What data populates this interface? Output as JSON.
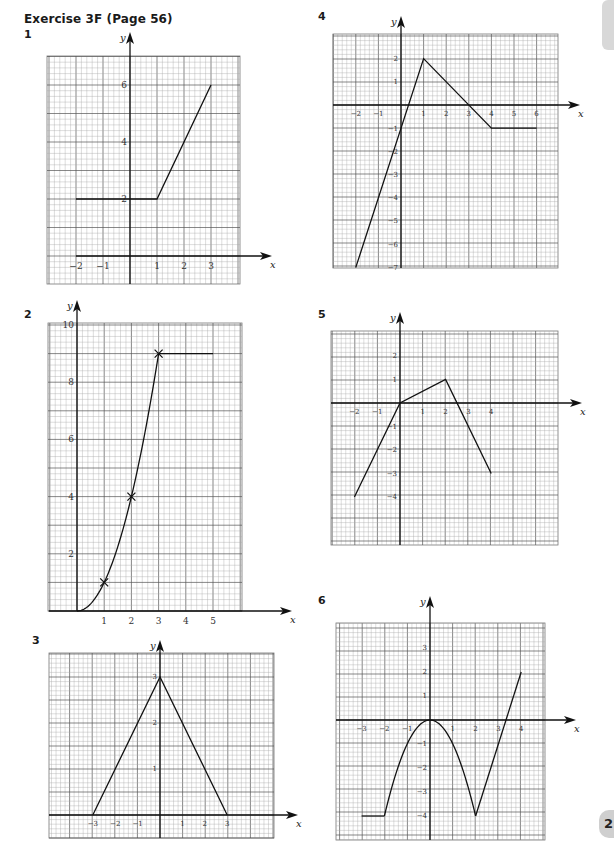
{
  "page": {
    "title": "Exercise 3F (Page 56)",
    "page_number_partial": "2"
  },
  "chart_data": [
    {
      "id": "1",
      "type": "line",
      "title": "1",
      "xlabel": "x",
      "ylabel": "y",
      "grid": true,
      "box": {
        "left": 47,
        "top": 56,
        "right": 240,
        "bottom": 284
      },
      "origin": {
        "x": 130,
        "y": 256
      },
      "unit": {
        "x": 27,
        "y": 28.5
      },
      "axis_x_start": 76,
      "axis_x_end": 272,
      "axis_y_top": 32,
      "xticks": [
        {
          "v": -2,
          "t": "−2"
        },
        {
          "v": -1,
          "t": "−1"
        },
        {
          "v": 1,
          "t": "1"
        },
        {
          "v": 2,
          "t": "2"
        },
        {
          "v": 3,
          "t": "3"
        }
      ],
      "yticks": [
        {
          "v": 2,
          "t": "2"
        },
        {
          "v": 4,
          "t": "4"
        },
        {
          "v": 6,
          "t": "6"
        }
      ],
      "series": [
        {
          "name": "graph",
          "kind": "polyline",
          "points": [
            [
              -2,
              2
            ],
            [
              1,
              2
            ],
            [
              3,
              6
            ]
          ]
        }
      ],
      "label_pos": {
        "x": 24,
        "y": 38
      }
    },
    {
      "id": "2",
      "type": "line",
      "title": "2",
      "xlabel": "x",
      "ylabel": "y",
      "grid": true,
      "box": {
        "left": 48,
        "top": 323,
        "right": 242,
        "bottom": 611
      },
      "origin": {
        "x": 77,
        "y": 611
      },
      "unit": {
        "x": 27.2,
        "y": 28.6
      },
      "axis_x_start": 49,
      "axis_x_end": 292,
      "axis_y_top": 300,
      "xticks": [
        {
          "v": 1,
          "t": "1"
        },
        {
          "v": 2,
          "t": "2"
        },
        {
          "v": 3,
          "t": "3"
        },
        {
          "v": 4,
          "t": "4"
        },
        {
          "v": 5,
          "t": "5"
        }
      ],
      "yticks": [
        {
          "v": 2,
          "t": "2"
        },
        {
          "v": 4,
          "t": "4"
        },
        {
          "v": 6,
          "t": "6"
        },
        {
          "v": 8,
          "t": "8"
        },
        {
          "v": 10,
          "t": "10"
        }
      ],
      "series": [
        {
          "name": "curve y=x^2",
          "kind": "function",
          "fn": "x*x",
          "domain": [
            0,
            3
          ]
        },
        {
          "name": "flat",
          "kind": "polyline",
          "points": [
            [
              3,
              9
            ],
            [
              5,
              9
            ]
          ]
        }
      ],
      "markers": [
        [
          1,
          1
        ],
        [
          2,
          4
        ],
        [
          3,
          9
        ]
      ],
      "label_pos": {
        "x": 24,
        "y": 318
      }
    },
    {
      "id": "3",
      "type": "line",
      "title": "3",
      "xlabel": "x",
      "ylabel": "y",
      "grid": true,
      "box": {
        "left": 49,
        "top": 653,
        "right": 274,
        "bottom": 838
      },
      "origin": {
        "x": 160,
        "y": 815
      },
      "unit": {
        "x": 22.4,
        "y": 46
      },
      "axis_x_start": 49,
      "axis_x_end": 298,
      "axis_y_top": 640,
      "xticks": [
        {
          "v": -3,
          "t": "−3"
        },
        {
          "v": -2,
          "t": "−2"
        },
        {
          "v": -1,
          "t": "−1"
        },
        {
          "v": 1,
          "t": "1"
        },
        {
          "v": 2,
          "t": "2"
        },
        {
          "v": 3,
          "t": "3"
        }
      ],
      "yticks": [
        {
          "v": 1,
          "t": "1"
        },
        {
          "v": 2,
          "t": "2"
        },
        {
          "v": 3,
          "t": "3"
        }
      ],
      "series": [
        {
          "name": "graph",
          "kind": "polyline",
          "points": [
            [
              -3,
              0
            ],
            [
              0,
              3
            ],
            [
              3,
              0
            ]
          ]
        }
      ],
      "label_pos": {
        "x": 32,
        "y": 644
      }
    },
    {
      "id": "4",
      "type": "line",
      "title": "4",
      "xlabel": "x",
      "ylabel": "y",
      "grid": true,
      "box": {
        "left": 333,
        "top": 34,
        "right": 558,
        "bottom": 268
      },
      "origin": {
        "x": 401,
        "y": 105
      },
      "unit": {
        "x": 22.6,
        "y": 23.2
      },
      "axis_x_start": 333,
      "axis_x_end": 580,
      "axis_y_top": 16,
      "xticks": [
        {
          "v": -2,
          "t": "−2"
        },
        {
          "v": -1,
          "t": "−1"
        },
        {
          "v": 1,
          "t": "1"
        },
        {
          "v": 2,
          "t": "2"
        },
        {
          "v": 3,
          "t": "3"
        },
        {
          "v": 4,
          "t": "4"
        },
        {
          "v": 5,
          "t": "5"
        },
        {
          "v": 6,
          "t": "6"
        }
      ],
      "yticks": [
        {
          "v": 2,
          "t": "2"
        },
        {
          "v": 1,
          "t": "1"
        },
        {
          "v": -1,
          "t": "−1"
        },
        {
          "v": -2,
          "t": "−2"
        },
        {
          "v": -3,
          "t": "−3"
        },
        {
          "v": -4,
          "t": "−4"
        },
        {
          "v": -5,
          "t": "−5"
        },
        {
          "v": -6,
          "t": "−6"
        },
        {
          "v": -7,
          "t": "−7"
        }
      ],
      "series": [
        {
          "name": "graph",
          "kind": "polyline",
          "points": [
            [
              -2,
              -7
            ],
            [
              1,
              2
            ],
            [
              4,
              -1
            ],
            [
              6,
              -1
            ]
          ]
        }
      ],
      "label_pos": {
        "x": 318,
        "y": 20
      }
    },
    {
      "id": "5",
      "type": "line",
      "title": "5",
      "xlabel": "x",
      "ylabel": "y",
      "grid": true,
      "box": {
        "left": 331,
        "top": 331,
        "right": 558,
        "bottom": 545
      },
      "origin": {
        "x": 400,
        "y": 403
      },
      "unit": {
        "x": 22.8,
        "y": 23.5
      },
      "axis_x_start": 331,
      "axis_x_end": 582,
      "axis_y_top": 312,
      "xticks": [
        {
          "v": -2,
          "t": "−2"
        },
        {
          "v": -1,
          "t": "−1"
        },
        {
          "v": 1,
          "t": "1"
        },
        {
          "v": 2,
          "t": "2"
        },
        {
          "v": 3,
          "t": "3"
        },
        {
          "v": 4,
          "t": "4"
        }
      ],
      "yticks": [
        {
          "v": 2,
          "t": "2"
        },
        {
          "v": 1,
          "t": "1"
        },
        {
          "v": -1,
          "t": "−1"
        },
        {
          "v": -2,
          "t": "−2"
        },
        {
          "v": -3,
          "t": "−3"
        },
        {
          "v": -4,
          "t": "−4"
        }
      ],
      "series": [
        {
          "name": "graph",
          "kind": "polyline",
          "points": [
            [
              -2,
              -4
            ],
            [
              0,
              0
            ],
            [
              2,
              1
            ],
            [
              4,
              -3
            ]
          ]
        }
      ],
      "label_pos": {
        "x": 318,
        "y": 318
      }
    },
    {
      "id": "6",
      "type": "line",
      "title": "6",
      "xlabel": "x",
      "ylabel": "y",
      "grid": true,
      "box": {
        "left": 336,
        "top": 623,
        "right": 545,
        "bottom": 840
      },
      "origin": {
        "x": 430,
        "y": 720
      },
      "unit": {
        "x": 22.8,
        "y": 24
      },
      "axis_x_start": 336,
      "axis_x_end": 576,
      "axis_y_top": 596,
      "xticks": [
        {
          "v": -3,
          "t": "−3"
        },
        {
          "v": -2,
          "t": "−2"
        },
        {
          "v": -1,
          "t": "−1"
        },
        {
          "v": 1,
          "t": "1"
        },
        {
          "v": 2,
          "t": "2"
        },
        {
          "v": 3,
          "t": "3"
        },
        {
          "v": 4,
          "t": "4"
        }
      ],
      "yticks": [
        {
          "v": 3,
          "t": "3"
        },
        {
          "v": 2,
          "t": "2"
        },
        {
          "v": 1,
          "t": "1"
        },
        {
          "v": -1,
          "t": "−1"
        },
        {
          "v": -2,
          "t": "−2"
        },
        {
          "v": -3,
          "t": "−3"
        },
        {
          "v": -4,
          "t": "−4"
        }
      ],
      "series": [
        {
          "name": "flat",
          "kind": "polyline",
          "points": [
            [
              -3,
              -4
            ],
            [
              -2,
              -4
            ]
          ]
        },
        {
          "name": "curve y=-x^2",
          "kind": "function",
          "fn": "-x*x",
          "domain": [
            -2,
            2
          ]
        },
        {
          "name": "line",
          "kind": "polyline",
          "points": [
            [
              2,
              -4
            ],
            [
              4,
              2
            ]
          ]
        }
      ],
      "label_pos": {
        "x": 318,
        "y": 604
      }
    }
  ]
}
